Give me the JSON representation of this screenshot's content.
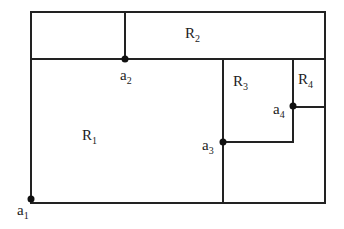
{
  "diagram": {
    "regions": [
      {
        "id": "R1",
        "base": "R",
        "sub": "1",
        "x": 82,
        "y": 128
      },
      {
        "id": "R2",
        "base": "R",
        "sub": "2",
        "x": 185,
        "y": 26
      },
      {
        "id": "R3",
        "base": "R",
        "sub": "3",
        "x": 233,
        "y": 74
      },
      {
        "id": "R4",
        "base": "R",
        "sub": "4",
        "x": 298,
        "y": 72
      }
    ],
    "points": [
      {
        "id": "a1",
        "base": "a",
        "sub": "1",
        "cx": 31,
        "cy": 199,
        "lx": 17,
        "ly": 203
      },
      {
        "id": "a2",
        "base": "a",
        "sub": "2",
        "cx": 125,
        "cy": 59,
        "lx": 120,
        "ly": 68
      },
      {
        "id": "a3",
        "base": "a",
        "sub": "3",
        "cx": 223,
        "cy": 142,
        "lx": 202,
        "ly": 138
      },
      {
        "id": "a4",
        "base": "a",
        "sub": "4",
        "cx": 293,
        "cy": 106,
        "lx": 273,
        "ly": 102
      }
    ],
    "line_color": "#222222"
  }
}
